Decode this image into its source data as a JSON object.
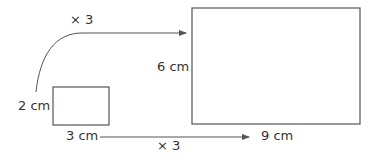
{
  "diagram": {
    "top_scale": "× 3",
    "bottom_scale": "× 3",
    "small_rect": {
      "height_label": "2 cm",
      "width_label": "3 cm"
    },
    "large_rect": {
      "height_label": "6 cm",
      "width_label": "9 cm"
    },
    "stroke_color": "#555555"
  }
}
